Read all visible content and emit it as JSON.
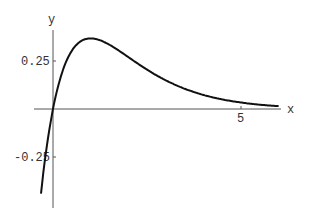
{
  "chart_data": {
    "type": "line",
    "title": "",
    "xlabel": "x",
    "ylabel": "y",
    "xlim": [
      -0.32,
      6.0
    ],
    "ylim": [
      -0.52,
      0.4
    ],
    "x_ticks": [
      {
        "value": 5,
        "label": "5"
      }
    ],
    "y_ticks": [
      {
        "value": 0.25,
        "label": "0.25"
      },
      {
        "value": -0.25,
        "label": "-0.25"
      }
    ],
    "grid": false,
    "legend": null,
    "series": [
      {
        "name": "x*exp(-x)",
        "x": [
          -0.32,
          -0.25,
          0,
          0.25,
          0.5,
          0.75,
          1,
          1.5,
          2,
          2.5,
          3,
          3.5,
          4,
          4.5,
          5,
          5.5,
          6
        ],
        "values": [
          -0.44,
          -0.32,
          0,
          0.195,
          0.303,
          0.354,
          0.368,
          0.335,
          0.271,
          0.205,
          0.149,
          0.106,
          0.073,
          0.05,
          0.034,
          0.022,
          0.015
        ]
      }
    ],
    "colors": {
      "curve": "#111111",
      "axes": "#555555",
      "text": "#333333"
    }
  }
}
